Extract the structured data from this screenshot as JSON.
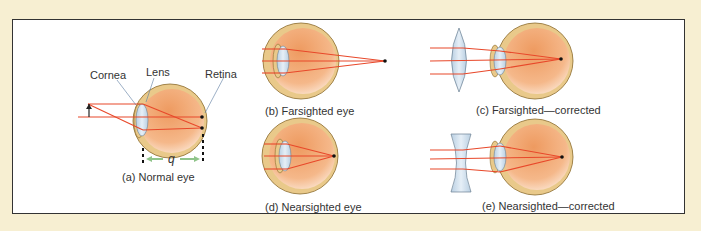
{
  "figure": {
    "colors": {
      "background": "#f7efd2",
      "panel": "#ffffff",
      "ray": "#e8482a",
      "eyeball_outer": "#e9c98a",
      "eyeball_inner": "#f2a46e",
      "lens": "#cfe0ee",
      "arrow_green": "#8fc48a"
    },
    "panels": [
      {
        "id": "a",
        "caption": "(a) Normal eye"
      },
      {
        "id": "b",
        "caption": "(b) Farsighted eye"
      },
      {
        "id": "c",
        "caption": "(c) Farsighted—corrected"
      },
      {
        "id": "d",
        "caption": "(d) Nearsighted eye"
      },
      {
        "id": "e",
        "caption": "(e) Nearsighted—corrected"
      }
    ],
    "labels": {
      "cornea": "Cornea",
      "lens": "Lens",
      "retina": "Retina",
      "distance": "q"
    }
  }
}
